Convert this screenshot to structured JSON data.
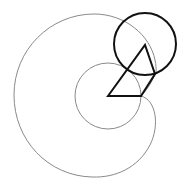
{
  "diagram": {
    "width": 189,
    "height": 186,
    "background": "#ffffff",
    "colors": {
      "thin_curve": "#8a8a8a",
      "bold_shape": "#111111"
    },
    "small_circle": {
      "cx": 108,
      "cy": 96,
      "r": 33
    },
    "bold_circle": {
      "cx": 145,
      "cy": 44,
      "r": 31
    },
    "polygon_points": "108,96 145,45 155,74 141,96",
    "outer_curve_path": "M141,96 C156,100 160,125 150,145 C138,168 115,178 92,177 C48,176 14,140 14,95 C14,50 50,14 94,14 C125,14 150,35 155,60 C157,70 156,74 155,74 C151,84 146,91 141,96"
  }
}
